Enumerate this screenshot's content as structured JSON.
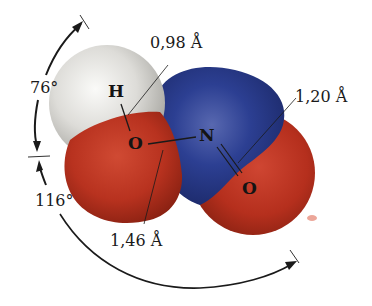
{
  "molecule": {
    "name": "HNO2",
    "atoms": [
      {
        "symbol": "H",
        "color": "#dcdcd8",
        "role": "hydrogen"
      },
      {
        "symbol": "O",
        "color": "#b8321f",
        "role": "hydroxyl-oxygen"
      },
      {
        "symbol": "N",
        "color": "#263a8c",
        "role": "nitrogen"
      },
      {
        "symbol": "O",
        "color": "#b8321f",
        "role": "double-bonded-oxygen"
      }
    ],
    "bonds": [
      {
        "from": "H",
        "to": "O",
        "type": "single"
      },
      {
        "from": "O",
        "to": "N",
        "type": "single"
      },
      {
        "from": "N",
        "to": "O",
        "type": "double"
      }
    ]
  },
  "labels": {
    "bond_oh": "0,98 Å",
    "bond_no_double": "1,20 Å",
    "bond_no_single": "1,46 Å",
    "angle_hon": "76°",
    "angle_ono": "116°"
  },
  "colors": {
    "oxygen": "#b8321f",
    "nitrogen": "#263a8c",
    "hydrogen": "#dcdcd8",
    "annotation": "#1a1a1a"
  }
}
